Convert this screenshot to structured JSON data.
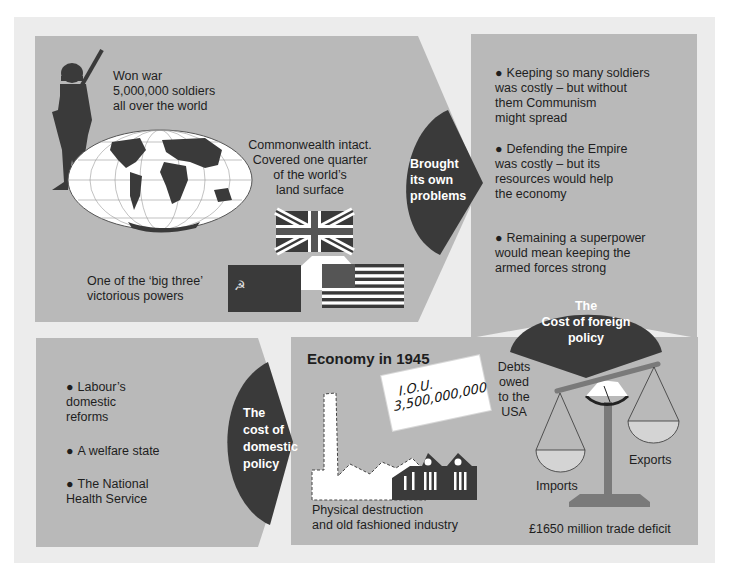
{
  "colors": {
    "background": "#ffffff",
    "frame": "#ececec",
    "panel": "#b9b9b9",
    "dark": "#3a3a3a",
    "text": "#1e1e1e",
    "pan_fill": "#d4d4d4",
    "scale_gray": "#7a7a7a"
  },
  "top_left": {
    "soldier_text": [
      "Won war",
      "5,000,000 soldiers",
      "all over the world"
    ],
    "commonwealth_text": [
      "Commonwealth intact.",
      "Covered one quarter",
      "of the world’s",
      "land surface"
    ],
    "big_three_text": [
      "One of the ‘big three’",
      "victorious powers"
    ],
    "flags": [
      "United Kingdom",
      "Soviet Union",
      "United States"
    ]
  },
  "connector_top": {
    "label": [
      "Brought",
      "its own",
      "problems"
    ]
  },
  "top_right": {
    "bullets": [
      [
        "Keeping so many soldiers",
        "was costly – but without",
        "them Communism",
        "might spread"
      ],
      [
        "Defending the Empire",
        "was costly – but its",
        "resources would help",
        "the economy"
      ],
      [
        "Remaining a superpower",
        "would mean keeping the",
        "armed forces strong"
      ]
    ],
    "badge": [
      "The",
      "Cost of foreign",
      "policy"
    ]
  },
  "bottom_left": {
    "bullets": [
      [
        "Labour’s",
        "domestic",
        "reforms"
      ],
      [
        "A welfare state"
      ],
      [
        "The National",
        "Health Service"
      ]
    ],
    "badge": [
      "The",
      "cost of",
      "domestic",
      "policy"
    ]
  },
  "bottom_right": {
    "title": "Economy in 1945",
    "iou": {
      "line1": "I.O.U.",
      "line2": "3,500,000,000"
    },
    "debts_text": [
      "Debts",
      "owed",
      "to the",
      "USA"
    ],
    "industry_caption": [
      "Physical destruction",
      "and old fashioned industry"
    ],
    "scale": {
      "left_pan": "Imports",
      "right_pan": "Exports",
      "caption": "£1650 million trade deficit"
    }
  }
}
